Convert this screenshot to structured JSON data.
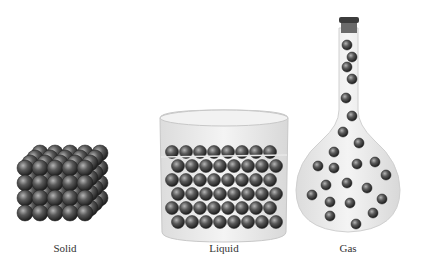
{
  "figure": {
    "panels": [
      {
        "label": "Solid"
      },
      {
        "label": "Liquid"
      },
      {
        "label": "Gas"
      }
    ],
    "colors": {
      "particle": "#3a3a3a",
      "particle_highlight": "#9a9a9a",
      "glass": "#e6e6e6",
      "stopper": "#444444"
    }
  }
}
